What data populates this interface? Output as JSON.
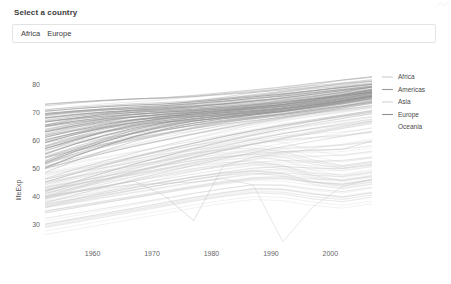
{
  "control": {
    "label": "Select a country",
    "selected": [
      "Africa",
      "Europe"
    ],
    "placeholder": ""
  },
  "chart_data": {
    "type": "line",
    "title": "",
    "xlabel": "",
    "ylabel": "lifeExp",
    "xlim": [
      1952,
      2007
    ],
    "ylim": [
      25,
      83
    ],
    "xticks": [
      1960,
      1970,
      1980,
      1990,
      2000
    ],
    "yticks": [
      30,
      40,
      50,
      60,
      70,
      80
    ],
    "grid": false,
    "legend_position": "right",
    "legend": [
      {
        "name": "Africa",
        "color": "#b9b9b9"
      },
      {
        "name": "Americas",
        "color": "#9a9a9a"
      },
      {
        "name": "Asia",
        "color": "#c2c2c2"
      },
      {
        "name": "Europe",
        "color": "#8f8f8f"
      },
      {
        "name": "Oceania",
        "color": "#ffffff"
      }
    ],
    "x": [
      1952,
      1957,
      1962,
      1967,
      1972,
      1977,
      1982,
      1987,
      1992,
      1997,
      2002,
      2007
    ],
    "series": [
      {
        "name": "Europe-A",
        "group": "Europe",
        "values": [
          69.6,
          70.5,
          71.2,
          71.9,
          72.4,
          73.1,
          74.0,
          74.9,
          75.8,
          77.0,
          78.1,
          79.3
        ]
      },
      {
        "name": "Europe-B",
        "group": "Europe",
        "values": [
          70.4,
          71.3,
          72.0,
          72.6,
          73.0,
          73.7,
          74.6,
          75.5,
          76.5,
          77.7,
          78.8,
          80.0
        ]
      },
      {
        "name": "Europe-C",
        "group": "Europe",
        "values": [
          68.0,
          69.2,
          70.1,
          70.8,
          71.3,
          72.0,
          73.0,
          74.1,
          75.2,
          76.5,
          77.8,
          79.0
        ]
      },
      {
        "name": "Europe-D",
        "group": "Europe",
        "values": [
          66.5,
          68.0,
          69.2,
          70.0,
          70.5,
          71.1,
          71.8,
          72.6,
          73.5,
          74.8,
          76.3,
          78.0
        ]
      },
      {
        "name": "Europe-E",
        "group": "Europe",
        "values": [
          65.0,
          66.8,
          68.2,
          69.3,
          70.0,
          70.6,
          71.2,
          71.9,
          72.8,
          74.0,
          75.6,
          77.4
        ]
      },
      {
        "name": "Europe-F",
        "group": "Europe",
        "values": [
          63.0,
          65.2,
          67.0,
          68.4,
          69.3,
          70.0,
          70.6,
          71.3,
          72.2,
          73.5,
          75.0,
          77.0
        ]
      },
      {
        "name": "Europe-G",
        "group": "Europe",
        "values": [
          61.0,
          63.5,
          65.6,
          67.3,
          68.5,
          69.4,
          70.2,
          71.0,
          72.0,
          73.3,
          74.9,
          76.8
        ]
      },
      {
        "name": "Europe-H",
        "group": "Europe",
        "values": [
          59.2,
          62.0,
          64.5,
          66.4,
          67.8,
          68.9,
          69.8,
          70.6,
          71.6,
          73.0,
          74.6,
          76.4
        ]
      },
      {
        "name": "Europe-I",
        "group": "Europe",
        "values": [
          57.0,
          60.2,
          63.0,
          65.3,
          67.0,
          68.3,
          69.4,
          70.3,
          71.3,
          72.7,
          74.3,
          76.2
        ]
      },
      {
        "name": "Europe-J",
        "group": "Europe",
        "values": [
          55.0,
          58.6,
          61.8,
          64.3,
          66.2,
          67.7,
          68.9,
          69.9,
          71.0,
          72.5,
          74.2,
          76.0
        ]
      },
      {
        "name": "Europe-K",
        "group": "Europe",
        "values": [
          52.0,
          56.0,
          59.5,
          62.5,
          64.9,
          66.8,
          68.2,
          69.4,
          70.6,
          72.2,
          74.0,
          75.8
        ]
      },
      {
        "name": "Europe-L",
        "group": "Europe",
        "values": [
          50.0,
          54.2,
          58.0,
          61.3,
          64.0,
          66.1,
          67.7,
          69.0,
          70.3,
          71.9,
          73.7,
          75.6
        ]
      },
      {
        "name": "Americas-A",
        "group": "Americas",
        "values": [
          68.8,
          69.9,
          70.8,
          71.4,
          72.0,
          72.9,
          74.0,
          75.0,
          76.0,
          77.2,
          78.2,
          79.4
        ]
      },
      {
        "name": "Americas-B",
        "group": "Americas",
        "values": [
          64.0,
          65.8,
          67.2,
          68.4,
          69.3,
          70.4,
          71.5,
          72.6,
          73.8,
          75.0,
          76.2,
          77.5
        ]
      },
      {
        "name": "Americas-C",
        "group": "Americas",
        "values": [
          59.0,
          61.2,
          63.0,
          64.6,
          66.0,
          67.5,
          68.9,
          70.2,
          71.5,
          72.8,
          74.0,
          75.3
        ]
      },
      {
        "name": "Americas-D",
        "group": "Americas",
        "values": [
          54.0,
          56.5,
          58.8,
          60.8,
          62.6,
          64.4,
          66.2,
          68.0,
          69.6,
          71.0,
          72.3,
          73.6
        ]
      },
      {
        "name": "Americas-E",
        "group": "Americas",
        "values": [
          50.0,
          52.8,
          55.4,
          57.8,
          60.0,
          62.2,
          64.3,
          66.3,
          68.0,
          69.6,
          71.0,
          72.4
        ]
      },
      {
        "name": "Americas-F",
        "group": "Americas",
        "values": [
          45.0,
          48.0,
          51.0,
          53.8,
          56.4,
          58.9,
          61.3,
          63.5,
          65.5,
          67.3,
          69.0,
          70.6
        ]
      },
      {
        "name": "Americas-G",
        "group": "Americas",
        "values": [
          42.0,
          45.2,
          48.4,
          51.4,
          54.2,
          56.9,
          59.4,
          61.8,
          64.0,
          66.0,
          67.8,
          69.5
        ]
      },
      {
        "name": "Asia-A",
        "group": "Asia",
        "values": [
          63.0,
          65.5,
          68.0,
          70.0,
          71.5,
          73.0,
          74.5,
          75.9,
          77.2,
          78.4,
          79.4,
          80.5
        ]
      },
      {
        "name": "Asia-B",
        "group": "Asia",
        "values": [
          58.0,
          60.8,
          63.4,
          65.6,
          67.4,
          69.2,
          71.0,
          72.6,
          74.0,
          75.4,
          76.6,
          77.9
        ]
      },
      {
        "name": "Asia-C",
        "group": "Asia",
        "values": [
          52.0,
          55.0,
          57.8,
          60.2,
          62.4,
          64.6,
          66.6,
          68.4,
          70.0,
          71.5,
          72.8,
          74.2
        ]
      },
      {
        "name": "Asia-D",
        "group": "Asia",
        "values": [
          45.0,
          48.2,
          51.2,
          54.0,
          56.6,
          59.0,
          61.3,
          63.4,
          65.3,
          67.0,
          68.6,
          70.2
        ]
      },
      {
        "name": "Asia-E",
        "group": "Asia",
        "values": [
          40.0,
          43.0,
          46.0,
          48.8,
          51.5,
          54.0,
          56.4,
          58.6,
          60.6,
          62.4,
          64.2,
          66.0
        ]
      },
      {
        "name": "Asia-F",
        "group": "Asia",
        "values": [
          37.5,
          40.4,
          43.2,
          45.9,
          48.5,
          51.0,
          53.4,
          55.6,
          57.7,
          59.6,
          61.4,
          63.2
        ]
      },
      {
        "name": "Asia-Cambodia",
        "group": "Asia",
        "values": [
          39.4,
          41.4,
          43.4,
          45.4,
          40.3,
          31.2,
          50.9,
          53.9,
          55.8,
          56.5,
          56.8,
          59.7
        ]
      },
      {
        "name": "Africa-A",
        "group": "Africa",
        "values": [
          48.0,
          50.0,
          52.0,
          54.0,
          56.0,
          58.0,
          60.0,
          62.0,
          64.0,
          65.5,
          67.0,
          68.5
        ]
      },
      {
        "name": "Africa-B",
        "group": "Africa",
        "values": [
          45.0,
          47.0,
          49.0,
          51.0,
          53.0,
          55.0,
          57.0,
          58.8,
          60.2,
          61.0,
          61.8,
          63.0
        ]
      },
      {
        "name": "Africa-C",
        "group": "Africa",
        "values": [
          42.0,
          44.0,
          46.0,
          48.0,
          50.0,
          52.0,
          53.8,
          55.2,
          56.0,
          56.2,
          56.8,
          58.0
        ]
      },
      {
        "name": "Africa-D",
        "group": "Africa",
        "values": [
          40.0,
          41.8,
          43.6,
          45.4,
          47.2,
          49.0,
          50.6,
          52.0,
          52.8,
          52.5,
          52.8,
          54.0
        ]
      },
      {
        "name": "Africa-E",
        "group": "Africa",
        "values": [
          38.0,
          39.8,
          41.6,
          43.4,
          45.2,
          47.0,
          48.6,
          50.0,
          50.6,
          50.0,
          49.8,
          51.0
        ]
      },
      {
        "name": "Africa-F",
        "group": "Africa",
        "values": [
          36.0,
          37.8,
          39.6,
          41.4,
          43.2,
          45.0,
          46.6,
          48.0,
          48.4,
          47.5,
          47.0,
          48.5
        ]
      },
      {
        "name": "Africa-G",
        "group": "Africa",
        "values": [
          34.0,
          35.8,
          37.6,
          39.4,
          41.2,
          43.0,
          44.6,
          46.0,
          46.2,
          45.0,
          44.2,
          45.8
        ]
      },
      {
        "name": "Africa-H",
        "group": "Africa",
        "values": [
          32.0,
          33.8,
          35.6,
          37.4,
          39.2,
          41.0,
          42.6,
          44.0,
          44.0,
          42.6,
          41.6,
          43.2
        ]
      },
      {
        "name": "Africa-I",
        "group": "Africa",
        "values": [
          30.0,
          31.9,
          33.8,
          35.7,
          37.6,
          39.5,
          41.2,
          42.6,
          42.4,
          40.8,
          39.6,
          41.2
        ]
      },
      {
        "name": "Africa-J",
        "group": "Africa",
        "values": [
          28.8,
          30.6,
          32.5,
          34.4,
          36.3,
          38.2,
          39.9,
          41.2,
          40.8,
          39.0,
          38.0,
          39.6
        ]
      },
      {
        "name": "Africa-K",
        "group": "Africa",
        "values": [
          43.0,
          45.0,
          47.0,
          49.0,
          51.0,
          52.8,
          54.2,
          55.0,
          54.0,
          51.5,
          50.0,
          51.5
        ]
      },
      {
        "name": "Africa-L",
        "group": "Africa",
        "values": [
          41.0,
          43.0,
          45.0,
          47.0,
          49.0,
          50.8,
          52.0,
          52.6,
          51.0,
          47.5,
          45.5,
          47.0
        ]
      },
      {
        "name": "Africa-Rwanda",
        "group": "Africa",
        "values": [
          40.0,
          41.5,
          43.0,
          44.1,
          44.6,
          45.0,
          46.2,
          44.0,
          23.6,
          36.1,
          43.4,
          46.2
        ]
      },
      {
        "name": "Africa-M",
        "group": "Africa",
        "values": [
          46.0,
          48.2,
          50.2,
          52.0,
          53.8,
          55.4,
          56.6,
          57.2,
          56.0,
          53.0,
          51.0,
          52.5
        ]
      },
      {
        "name": "Africa-N",
        "group": "Africa",
        "values": [
          37.0,
          39.0,
          41.0,
          43.0,
          45.0,
          46.8,
          48.2,
          49.0,
          48.0,
          45.0,
          43.5,
          45.0
        ]
      },
      {
        "name": "Oceania-A",
        "group": "Oceania",
        "values": [
          69.1,
          70.3,
          70.9,
          71.1,
          71.9,
          73.5,
          74.7,
          76.3,
          77.6,
          78.8,
          80.4,
          81.2
        ]
      },
      {
        "name": "Oceania-B",
        "group": "Oceania",
        "values": [
          69.4,
          70.3,
          71.2,
          71.5,
          71.9,
          72.2,
          73.8,
          74.3,
          76.3,
          77.6,
          79.1,
          80.2
        ]
      }
    ]
  }
}
